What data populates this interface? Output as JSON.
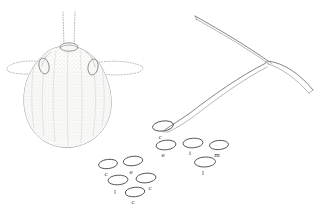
{
  "figure": {
    "background_color": "#ffffff",
    "width": 324,
    "height": 210,
    "ink_color": "#4a4a4a",
    "stipple_color": "#9a9a9a",
    "guide_color": "#9b9b9b"
  },
  "specimen_body": {
    "name": "stippled-ovoid-body",
    "description": "Stippled ovoid specimen outline with paired lateral lobes",
    "fill_color": "#fbfbfa",
    "outline_color": "#8e8e8e"
  },
  "guides": {
    "name": "dotted-construction-guides",
    "vertical_count": 2,
    "horizontal_count": 2,
    "style": "dotted"
  },
  "appendage": {
    "name": "branching-filament",
    "description": "Thin branching filament with bent apex and tapering tips",
    "stroke_color": "#5c5c5c"
  },
  "ellipses": [
    {
      "id": "e1",
      "label": "c",
      "cx": 163,
      "cy": 126,
      "rx": 10.5,
      "ry": 5.0,
      "rot": -8,
      "label_x": 160,
      "label_y": 134
    },
    {
      "id": "e2",
      "label": "e",
      "cx": 166,
      "cy": 145,
      "rx": 10.0,
      "ry": 4.8,
      "rot": -6,
      "label_x": 163,
      "label_y": 152
    },
    {
      "id": "e3",
      "label": "i",
      "cx": 193,
      "cy": 143,
      "rx": 10.0,
      "ry": 4.8,
      "rot": -4,
      "label_x": 190,
      "label_y": 150
    },
    {
      "id": "e4",
      "label": "m",
      "cx": 219,
      "cy": 145,
      "rx": 9.5,
      "ry": 4.6,
      "rot": -5,
      "label_x": 217,
      "label_y": 152
    },
    {
      "id": "e5",
      "label": "l",
      "cx": 205,
      "cy": 162,
      "rx": 10.5,
      "ry": 5.0,
      "rot": -3,
      "label_x": 203,
      "label_y": 170
    },
    {
      "id": "e6",
      "label": "c",
      "cx": 108,
      "cy": 164,
      "rx": 9.5,
      "ry": 4.6,
      "rot": -7,
      "label_x": 106,
      "label_y": 171
    },
    {
      "id": "e7",
      "label": "e",
      "cx": 133,
      "cy": 161,
      "rx": 9.8,
      "ry": 4.7,
      "rot": -7,
      "label_x": 131,
      "label_y": 169
    },
    {
      "id": "e8",
      "label": "l",
      "cx": 118,
      "cy": 180,
      "rx": 10.0,
      "ry": 4.8,
      "rot": -4,
      "label_x": 115,
      "label_y": 189
    },
    {
      "id": "e9",
      "label": "c",
      "cx": 146,
      "cy": 178,
      "rx": 10.0,
      "ry": 4.8,
      "rot": -6,
      "label_x": 150,
      "label_y": 185
    },
    {
      "id": "e10",
      "label": "c",
      "cx": 135,
      "cy": 192,
      "rx": 9.8,
      "ry": 4.7,
      "rot": -6,
      "label_x": 133,
      "label_y": 199
    }
  ]
}
